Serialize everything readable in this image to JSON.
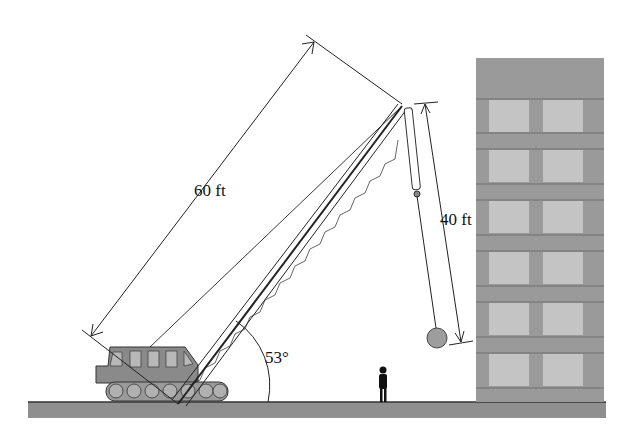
{
  "diagram": {
    "labels": {
      "boom_length": "60 ft",
      "cable_length": "40 ft",
      "boom_angle": "53°"
    },
    "colors": {
      "ground": "#8f8f8f",
      "building": "#9a9a9a",
      "window": "#c4c4c4",
      "crane_body": "#8a8a8a",
      "ball": "#9d9d9d",
      "line": "#222222"
    }
  }
}
